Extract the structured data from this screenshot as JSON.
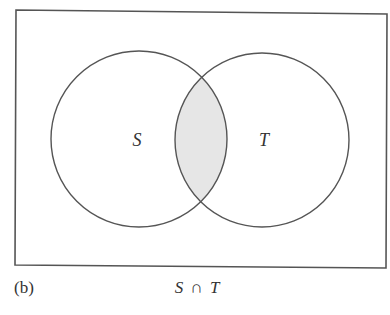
{
  "figure": {
    "panel_label": "(b)",
    "caption": {
      "left_set": "S",
      "operator": "∩",
      "right_set": "T"
    },
    "universe": {
      "shape": "rectangle",
      "corners": [
        [
          16,
          10
        ],
        [
          387,
          14
        ],
        [
          386,
          268
        ],
        [
          15,
          265
        ]
      ],
      "stroke": "#555555"
    },
    "sets": [
      {
        "label": "S",
        "cx": 139,
        "cy": 139,
        "r": 88,
        "label_x": 137,
        "label_y": 146
      },
      {
        "label": "T",
        "cx": 262,
        "cy": 140,
        "r": 87,
        "label_x": 264,
        "label_y": 146
      }
    ],
    "shaded_region": {
      "description": "intersection of S and T",
      "fill": "#e6e6e6"
    },
    "colors": {
      "stroke": "#555555",
      "text": "#333333",
      "background": "#ffffff"
    }
  }
}
